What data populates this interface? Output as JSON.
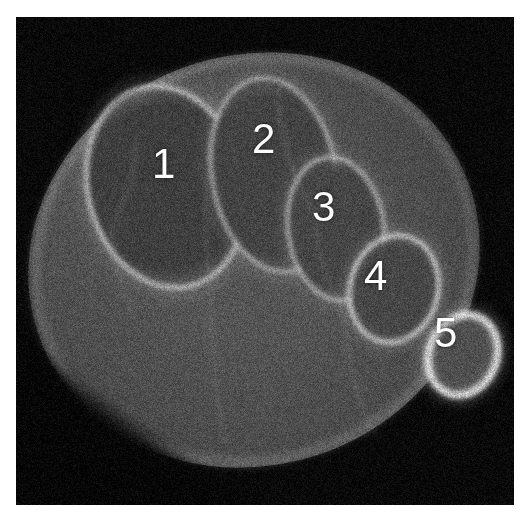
{
  "image": {
    "modality": "ct-axial-slice",
    "subject": "foot",
    "canvas": {
      "width": 524,
      "height": 517,
      "scan_left": 16,
      "scan_top": 17,
      "scan_width": 498,
      "scan_height": 488
    },
    "page_background_color": "#ffffff",
    "scan_background_color": "#0a0a0a",
    "soft_tissue_color": "#4c4c4c",
    "cortical_bone_color": "#d8d8d8",
    "label_color": "#fdfdfd",
    "noise_intensity": 0.34
  },
  "annotations": {
    "labels": [
      {
        "id": "metatarsal-1",
        "text": "1",
        "x": 152,
        "y": 143
      },
      {
        "id": "metatarsal-2",
        "text": "2",
        "x": 252,
        "y": 118
      },
      {
        "id": "metatarsal-3",
        "text": "3",
        "x": 312,
        "y": 186
      },
      {
        "id": "metatarsal-4",
        "text": "4",
        "x": 364,
        "y": 255
      },
      {
        "id": "metatarsal-5",
        "text": "5",
        "x": 434,
        "y": 312
      }
    ]
  },
  "anatomy": {
    "soft_tissue_envelope": {
      "cx": 238,
      "cy": 243,
      "rx": 228,
      "ry": 205,
      "rotation_deg": -19,
      "fill": "#4a4a4a",
      "rim": "#6f6f6f"
    },
    "bones": [
      {
        "name": "first-metatarsal",
        "label": "1",
        "cx": 150,
        "cy": 170,
        "rx": 78,
        "ry": 102,
        "rotation_deg": -14,
        "marrow": "#3f3f3f",
        "cortex": "#c9c9c9",
        "cortex_thickness": 5
      },
      {
        "name": "second-metatarsal",
        "label": "2",
        "cx": 258,
        "cy": 158,
        "rx": 62,
        "ry": 98,
        "rotation_deg": -10,
        "marrow": "#444444",
        "cortex": "#bdbdbd",
        "cortex_thickness": 4
      },
      {
        "name": "third-metatarsal",
        "label": "3",
        "cx": 320,
        "cy": 212,
        "rx": 48,
        "ry": 72,
        "rotation_deg": -8,
        "marrow": "#464646",
        "cortex": "#c2c2c2",
        "cortex_thickness": 4
      },
      {
        "name": "fourth-metatarsal",
        "label": "4",
        "cx": 378,
        "cy": 272,
        "rx": 44,
        "ry": 54,
        "rotation_deg": 14,
        "marrow": "#474747",
        "cortex": "#d2d2d2",
        "cortex_thickness": 5
      },
      {
        "name": "fifth-metatarsal",
        "label": "5",
        "cx": 447,
        "cy": 338,
        "rx": 34,
        "ry": 41,
        "rotation_deg": 22,
        "marrow": "#505050",
        "cortex": "#f0f0f0",
        "cortex_thickness": 8
      }
    ]
  }
}
